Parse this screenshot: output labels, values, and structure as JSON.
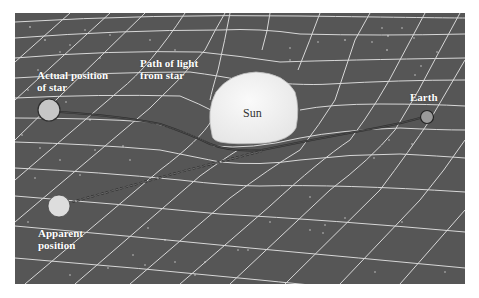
{
  "figure": {
    "colors": {
      "panel_background": "#565656",
      "grid_lines": "#e8e8e8",
      "sun_fill": "#f2f2f2",
      "star_fill": "#c8c8c8",
      "apparent_fill": "#dcdcdc",
      "earth_fill": "#9a9a9a",
      "light_path": "#2e2e2e",
      "label_text": "#ffffff"
    },
    "labels": {
      "actual_star_line1": "Actual position",
      "actual_star_line2": "of star",
      "path_line1": "Path of light",
      "path_line2": "from star",
      "sun": "Sun",
      "earth": "Earth",
      "apparent_line1": "Apparent",
      "apparent_line2": "position"
    },
    "objects": [
      {
        "name": "Actual position of star",
        "cx": 49,
        "cy": 110,
        "r": 11
      },
      {
        "name": "Apparent position",
        "cx": 59,
        "cy": 206,
        "r": 11
      },
      {
        "name": "Sun",
        "cx": 256,
        "cy": 112
      },
      {
        "name": "Earth",
        "cx": 427,
        "cy": 117,
        "r": 7
      }
    ],
    "paths": [
      {
        "name": "actual light path",
        "style": "solid",
        "from": "Actual position of star",
        "to": "Earth",
        "via": "Sun (bent)"
      },
      {
        "name": "apparent line of sight",
        "style": "dashed",
        "from": "Apparent position",
        "to": "Earth"
      }
    ]
  }
}
